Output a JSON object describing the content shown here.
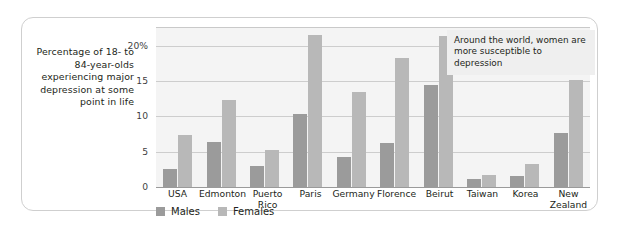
{
  "figure": {
    "y_axis_caption": "Percentage of 18- to 84-year-olds experiencing major depression at some point in life",
    "annotation": "Around the world, women are more susceptible to depression",
    "colors": {
      "males": "#9b9b9b",
      "females": "#b8b8b8",
      "plot_background": "#f4f4f4",
      "gridline": "#cdcdcd",
      "card_border": "#cfcfcf",
      "annotation_background": "#efefef",
      "text": "#231f20"
    }
  },
  "legend": {
    "items": [
      {
        "label": "Males",
        "key": "male"
      },
      {
        "label": "Females",
        "key": "female"
      }
    ]
  },
  "y_ticks": [
    {
      "label": "20%",
      "value": 20
    },
    {
      "label": "15",
      "value": 15
    },
    {
      "label": "10",
      "value": 10
    },
    {
      "label": "5",
      "value": 5
    },
    {
      "label": "0",
      "value": 0
    }
  ],
  "chart_data": {
    "type": "bar",
    "title": "",
    "xlabel": "",
    "ylabel": "Percentage of 18- to 84-year-olds experiencing major depression at some point in life",
    "ylim": [
      0,
      22.5
    ],
    "grid": true,
    "legend_position": "bottom-left",
    "annotations": [
      "Around the world, women are more susceptible to depression"
    ],
    "categories": [
      "USA",
      "Edmonton",
      "Puerto\nRico",
      "Paris",
      "Germany",
      "Florence",
      "Beirut",
      "Taiwan",
      "Korea",
      "New\nZealand"
    ],
    "series": [
      {
        "name": "Males",
        "color": "#9b9b9b",
        "values": [
          2.6,
          6.4,
          3.0,
          10.4,
          4.3,
          6.2,
          14.4,
          1.1,
          1.6,
          7.6
        ]
      },
      {
        "name": "Females",
        "color": "#b8b8b8",
        "values": [
          7.3,
          12.3,
          5.3,
          21.5,
          13.5,
          18.2,
          21.4,
          1.7,
          3.2,
          15.2
        ]
      }
    ]
  }
}
